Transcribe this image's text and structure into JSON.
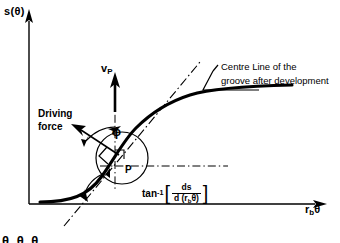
{
  "figure": {
    "axes": {
      "y_label": "s(θ)",
      "x_label_base": "r",
      "x_label_sub": "b",
      "x_label_theta": "θ"
    },
    "labels": {
      "velocity": "v",
      "velocity_sub": "P",
      "driving_force_line1": "Driving",
      "driving_force_line2": "force",
      "phi": "ϕ",
      "point": "P",
      "annotation_line1": "Centre Line of  the",
      "annotation_line2": "groove after development",
      "bottom_cut_text": "θ θ θ"
    },
    "formula": {
      "function": "tan",
      "exponent": "-1",
      "bracket_open": "[",
      "bracket_close": "]",
      "numerator": "ds",
      "denominator_prefix": "d (r",
      "denominator_sub": "b",
      "denominator_suffix": "θ)"
    },
    "colors": {
      "ink": "#000000",
      "background": "#ffffff"
    }
  }
}
